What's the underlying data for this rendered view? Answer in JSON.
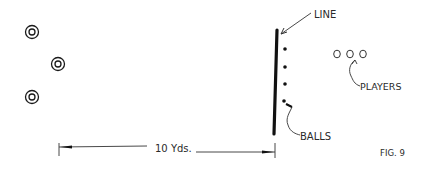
{
  "diagram": {
    "labels": {
      "line": "LINE",
      "balls": "BALLS",
      "players": "PLAYERS",
      "distance": "10 Yds.",
      "figure": "FIG. 9"
    },
    "left_markers": {
      "count": 3,
      "symbol": "concentric-circle"
    },
    "balls": {
      "count": 4
    },
    "players": {
      "count": 3
    },
    "colors": {
      "ink": "#1a1a1a",
      "background": "#ffffff"
    }
  }
}
